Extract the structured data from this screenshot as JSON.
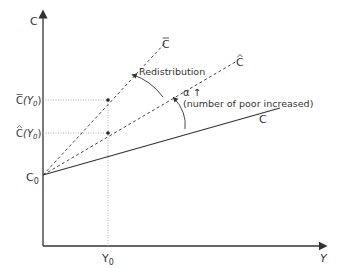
{
  "diagram": {
    "axes": {
      "y_label": "C",
      "x_label": "Y"
    },
    "intercept_label": "C",
    "intercept_sub": "0",
    "x_tick_label": "Y",
    "x_tick_sub": "0",
    "lines": [
      {
        "name": "C-bar",
        "label": "C",
        "accent": "bar",
        "style": "dashed"
      },
      {
        "name": "C-hat",
        "label": "C",
        "accent": "hat",
        "style": "dashed"
      },
      {
        "name": "C",
        "label": "C",
        "accent": "none",
        "style": "solid"
      }
    ],
    "y_ticks": [
      {
        "label": "C",
        "accent": "bar",
        "arg": "(Y",
        "sub": "0",
        "close": ")"
      },
      {
        "label": "C",
        "accent": "hat",
        "arg": "(Y",
        "sub": "0",
        "close": ")"
      }
    ],
    "annotations": {
      "redistribution": "Redistribution",
      "alpha": "α ↑",
      "alpha_note": "(number of poor increased)"
    },
    "colors": {
      "line": "#333333",
      "guide": "#888888"
    }
  }
}
